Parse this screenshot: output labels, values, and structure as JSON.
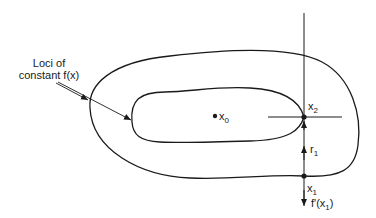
{
  "diagram": {
    "caption_line1": "Loci of",
    "caption_line2": "constant f(x)",
    "points": {
      "x0": {
        "base": "x",
        "sub": "0"
      },
      "x1": {
        "base": "x",
        "sub": "1"
      },
      "x2": {
        "base": "x",
        "sub": "2"
      }
    },
    "vector_r1": {
      "base": "r",
      "sub": "1"
    },
    "gradient_label": {
      "prefix": "f'(x",
      "sub": "1",
      "suffix": ")"
    },
    "colors": {
      "stroke": "#1a1a1a",
      "background": "#ffffff"
    }
  }
}
